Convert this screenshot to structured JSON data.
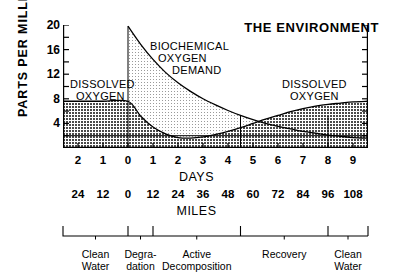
{
  "title": "THE ENVIRONMENT",
  "axes": {
    "y_label": "PARTS PER MILLION",
    "y_ticks": [
      20,
      16,
      12,
      8,
      4
    ],
    "y_minor_step": 2,
    "ylim": [
      0,
      20
    ],
    "days_name": "DAYS",
    "miles_name": "MILES",
    "days_ticks": [
      "2",
      "1",
      "0",
      "1",
      "2",
      "3",
      "4",
      "5",
      "6",
      "7",
      "8",
      "9"
    ],
    "miles_ticks": [
      "24",
      "12",
      "0",
      "12",
      "24",
      "36",
      "48",
      "60",
      "72",
      "84",
      "96",
      "108"
    ]
  },
  "annotations": {
    "do_left": [
      "DISSOLVED",
      "OXYGEN"
    ],
    "bod": [
      "BIOCHEMICAL",
      "OXYGEN",
      "DEMAND"
    ],
    "do_right": [
      "DISSOLVED",
      "OXYGEN"
    ]
  },
  "zones": [
    {
      "label": [
        "Clean",
        "Water"
      ],
      "start": -2.6,
      "end": 0.0
    },
    {
      "label": [
        "Degra-",
        "dation"
      ],
      "start": 0.0,
      "end": 1.0
    },
    {
      "label": [
        "Active",
        "Decomposition"
      ],
      "start": 1.0,
      "end": 4.5
    },
    {
      "label": [
        "Recovery"
      ],
      "start": 4.5,
      "end": 8.0
    },
    {
      "label": [
        "Clean",
        "Water"
      ],
      "start": 8.0,
      "end": 9.6
    }
  ],
  "colors": {
    "ink": "#000000",
    "do_fill": "#8f8f8f",
    "bod_fill": "#e2e2e2",
    "floor_fill": "#b8b8b8"
  },
  "chart_data": {
    "type": "area",
    "title": "THE ENVIRONMENT",
    "xlabel": "DAYS",
    "ylabel": "PARTS PER MILLION",
    "xlim": [
      -2.6,
      9.6
    ],
    "ylim": [
      0,
      20
    ],
    "grid": false,
    "legend": "in-plot annotations",
    "x": [
      -2.6,
      -2.0,
      -1.0,
      0.0,
      0.5,
      1.0,
      1.5,
      2.0,
      2.5,
      3.0,
      3.5,
      4.0,
      4.5,
      5.0,
      5.5,
      6.0,
      6.5,
      7.0,
      7.5,
      8.0,
      8.5,
      9.0,
      9.6
    ],
    "series": [
      {
        "name": "DISSOLVED OXYGEN",
        "values": [
          7.6,
          7.6,
          7.6,
          7.6,
          5.2,
          3.4,
          2.3,
          1.7,
          1.6,
          1.8,
          2.2,
          2.7,
          3.3,
          4.0,
          4.7,
          5.3,
          5.9,
          6.4,
          6.8,
          7.1,
          7.3,
          7.5,
          7.6
        ],
        "fill": "dark-crosshatch"
      },
      {
        "name": "BIOCHEMICAL OXYGEN DEMAND",
        "values": [
          null,
          null,
          null,
          19.8,
          16.9,
          14.4,
          12.3,
          10.6,
          9.2,
          8.0,
          7.0,
          6.1,
          5.3,
          4.6,
          4.0,
          3.5,
          3.1,
          2.7,
          2.4,
          2.1,
          1.9,
          1.7,
          1.6
        ],
        "fill": "light-stipple"
      }
    ],
    "reference_lines": [
      {
        "type": "horizontal",
        "value": 2.0
      },
      {
        "type": "vertical",
        "value": 0.0
      },
      {
        "type": "vertical",
        "value": 4.5
      },
      {
        "type": "vertical",
        "value": 8.0
      }
    ],
    "secondary_axis": {
      "name": "MILES",
      "ticks": [
        24,
        12,
        0,
        12,
        24,
        36,
        48,
        60,
        72,
        84,
        96,
        108
      ]
    }
  }
}
